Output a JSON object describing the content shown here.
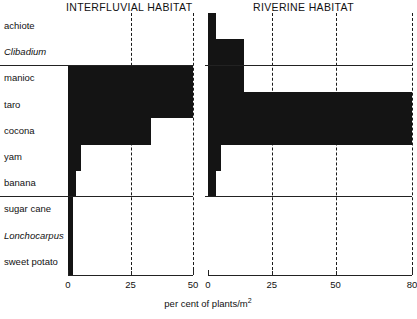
{
  "panels": {
    "left": {
      "title": "INTERFLUVIAL HABITAT"
    },
    "right": {
      "title": "RIVERINE HABITAT"
    }
  },
  "axis": {
    "title_text": "per cent of plants/m",
    "title_sup": "2",
    "left_ticks": [
      "0",
      "25",
      "50"
    ],
    "right_ticks": [
      "0",
      "25",
      "50",
      "80"
    ]
  },
  "rows": [
    {
      "label": "achiote",
      "italic": false
    },
    {
      "label": "Clibadium",
      "italic": true
    },
    {
      "label": "manioc",
      "italic": false
    },
    {
      "label": "taro",
      "italic": false
    },
    {
      "label": "cocona",
      "italic": false
    },
    {
      "label": "yam",
      "italic": false
    },
    {
      "label": "banana",
      "italic": false
    },
    {
      "label": "sugar cane",
      "italic": false
    },
    {
      "label": "Lonchocarpus",
      "italic": true
    },
    {
      "label": "sweet potato",
      "italic": false
    }
  ],
  "chart_data": {
    "type": "bar",
    "xlabel": "per cent of plants/m2",
    "ylabel": "",
    "orientation": "horizontal",
    "categories": [
      "achiote",
      "Clibadium",
      "manioc",
      "taro",
      "cocona",
      "yam",
      "banana",
      "sugar cane",
      "Lonchocarpus",
      "sweet potato"
    ],
    "grid": true,
    "legend": "none",
    "series": [
      {
        "name": "INTERFLUVIAL HABITAT",
        "xlim": [
          0,
          50
        ],
        "xticks": [
          0,
          25,
          50
        ],
        "gridlines": [
          25,
          50
        ],
        "values": [
          0,
          0,
          50,
          50,
          33,
          5,
          3,
          2,
          2,
          2
        ]
      },
      {
        "name": "RIVERINE HABITAT",
        "xlim": [
          0,
          80
        ],
        "xticks": [
          0,
          25,
          50,
          80
        ],
        "gridlines": [
          25,
          50,
          80
        ],
        "values": [
          3,
          14,
          14,
          80,
          80,
          5,
          3,
          0,
          0,
          0
        ]
      }
    ]
  },
  "colors": {
    "bar": "#141414",
    "axis": "#222222",
    "background": "#ffffff"
  }
}
